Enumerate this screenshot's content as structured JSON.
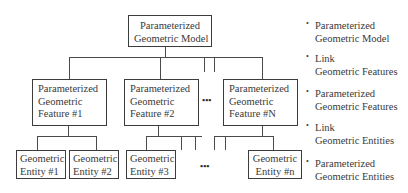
{
  "diagram": {
    "root": {
      "lines": [
        "Parameterized",
        "Geometric Model"
      ]
    },
    "features": [
      {
        "lines": [
          "Parameterized",
          "Geometric",
          "Feature #1"
        ]
      },
      {
        "lines": [
          "Parameterized",
          "Geometric",
          "Feature #2"
        ]
      },
      {
        "lines": [
          "Parameterized",
          "Geometric",
          "Feature #N"
        ]
      }
    ],
    "entities": [
      {
        "lines": [
          "Geometric",
          "Entity #1"
        ]
      },
      {
        "lines": [
          "Geometric",
          "Entity #2"
        ]
      },
      {
        "lines": [
          "Geometric",
          "Entity #3"
        ]
      },
      {
        "lines": [
          "Geometric",
          "Entity #n"
        ]
      }
    ],
    "ellipsis": "•••",
    "legend": [
      {
        "bullet": "•",
        "lines": [
          "Parameterized",
          "Geometric Model"
        ]
      },
      {
        "bullet": "•",
        "lines": [
          "Link",
          "Geometric Features"
        ]
      },
      {
        "bullet": "•",
        "lines": [
          "Parameterized",
          "Geometric Features"
        ]
      },
      {
        "bullet": "•",
        "lines": [
          "Link",
          "Geometric Entities"
        ]
      },
      {
        "bullet": "•",
        "lines": [
          "Parameterized",
          "Geometric Entities"
        ]
      }
    ]
  }
}
